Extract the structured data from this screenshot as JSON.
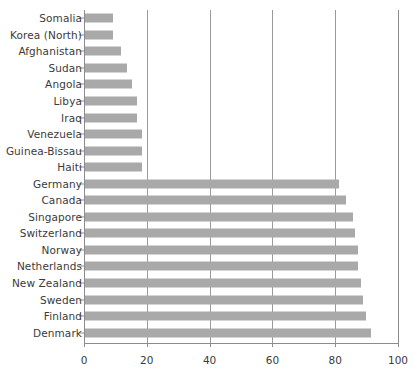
{
  "chart_data": {
    "type": "bar",
    "orientation": "horizontal",
    "title": "",
    "xlabel": "",
    "ylabel": "",
    "xlim": [
      0,
      100
    ],
    "xticks": [
      0,
      20,
      40,
      60,
      80,
      100
    ],
    "xtick_labels": [
      "0",
      "20",
      "40",
      "60",
      "80",
      "100"
    ],
    "grid": true,
    "gridlines_axis": "x",
    "legend": null,
    "bar_color": "#a9a9a9",
    "background_color": "#ffffff",
    "axis_color": "#8c8c8c",
    "label_color": "#3b3b3b",
    "categories": [
      "Somalia",
      "Korea (North)",
      "Afghanistan",
      "Sudan",
      "Angola",
      "Libya",
      "Iraq",
      "Venezuela",
      "Guinea-Bissau",
      "Haiti",
      "Germany",
      "Canada",
      "Singapore",
      "Switzerland",
      "Norway",
      "Netherlands",
      "New Zealand",
      "Sweden",
      "Finland",
      "Denmark"
    ],
    "values": [
      9,
      9,
      11.5,
      13.5,
      15,
      16.5,
      16.5,
      18,
      18,
      18,
      81,
      83,
      85.5,
      86,
      87,
      87,
      88,
      88.5,
      89.5,
      91
    ]
  }
}
